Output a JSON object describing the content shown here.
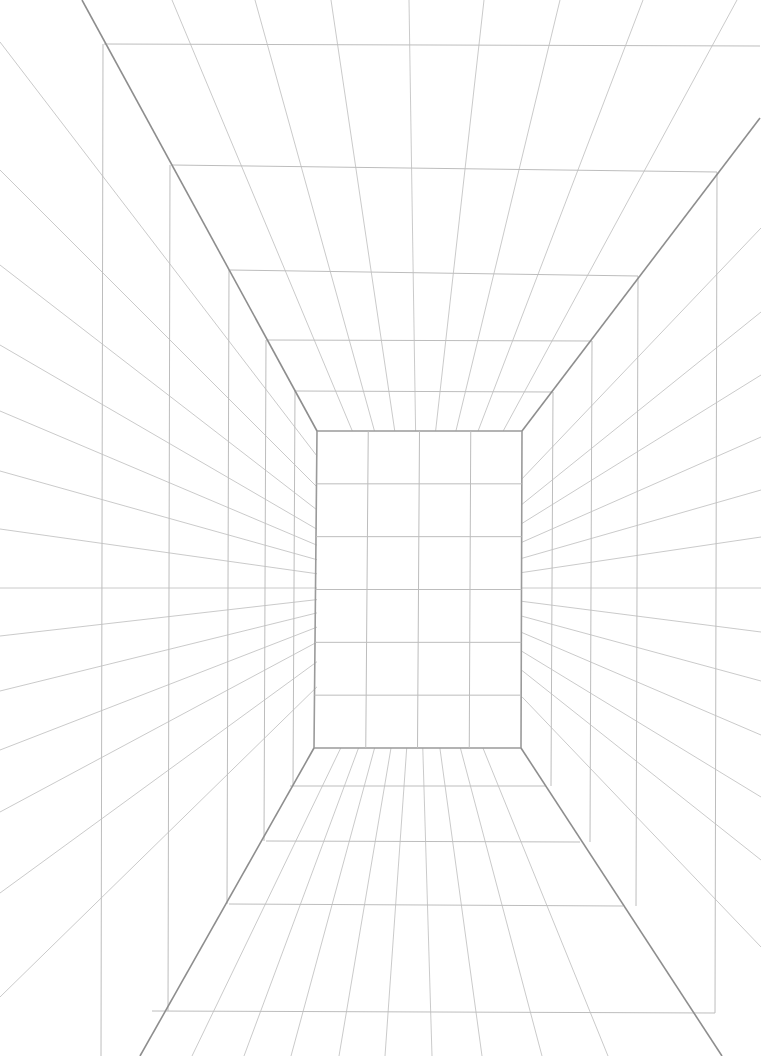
{
  "drawing": {
    "type": "one-point perspective room grid",
    "colors": {
      "background": "#ffffff",
      "guide": "#c4c4c4",
      "grid": "#bdbdbd",
      "edge": "#8e8e8e",
      "back": "#9a9a9a"
    },
    "vanishing_point": [
      418,
      588
    ],
    "back_wall": {
      "tl": [
        317,
        431
      ],
      "tr": [
        522,
        431
      ],
      "bl": [
        314,
        748
      ],
      "br": [
        521,
        748
      ],
      "cols": 4,
      "rows": 6
    },
    "corner_edges": [
      [
        [
          82,
          0
        ],
        [
          317,
          431
        ]
      ],
      [
        [
          760,
          118
        ],
        [
          522,
          431
        ]
      ],
      [
        [
          140,
          1056
        ],
        [
          314,
          748
        ]
      ],
      [
        [
          722,
          1056
        ],
        [
          521,
          748
        ]
      ]
    ],
    "ceiling_rays_top_x": [
      172,
      255,
      331,
      409,
      484,
      560,
      643,
      737
    ],
    "floor_rays_bottom_x": [
      192,
      244,
      291,
      339,
      385,
      432,
      482,
      542,
      608
    ],
    "left_rays_edge_y": [
      42,
      170,
      265,
      345,
      411,
      471,
      529,
      588,
      636,
      691,
      750,
      812,
      893,
      997
    ],
    "right_rays_edge_y": [
      228,
      312,
      375,
      437,
      490,
      537,
      588,
      632,
      681,
      735,
      797,
      860,
      947
    ],
    "ceiling_horizontals": [
      {
        "y1": 44,
        "y2": 46,
        "x1": 104,
        "x2": 760
      },
      {
        "y1": 165,
        "y2": 172,
        "x1": 172,
        "x2": 717
      },
      {
        "y1": 270,
        "y2": 276,
        "x1": 230,
        "x2": 638
      },
      {
        "y1": 340,
        "y2": 341,
        "x1": 267,
        "x2": 592
      },
      {
        "y1": 391,
        "y2": 392,
        "x1": 295,
        "x2": 553
      }
    ],
    "floor_horizontals": [
      {
        "y1": 786,
        "y2": 786,
        "x1": 290,
        "x2": 546
      },
      {
        "y1": 841,
        "y2": 842,
        "x1": 266,
        "x2": 580
      },
      {
        "y1": 904,
        "y2": 906,
        "x1": 229,
        "x2": 623
      },
      {
        "y1": 1011,
        "y2": 1013,
        "x1": 152,
        "x2": 715
      }
    ],
    "left_verticals": [
      {
        "x": 103,
        "y1": 44,
        "y2": 1056
      },
      {
        "x": 170,
        "y1": 165,
        "y2": 1011
      },
      {
        "x": 229,
        "y1": 270,
        "y2": 904
      },
      {
        "x": 266,
        "y1": 340,
        "y2": 841
      },
      {
        "x": 295,
        "y1": 391,
        "y2": 786
      }
    ],
    "right_verticals": [
      {
        "x": 717,
        "y1": 172,
        "y2": 1013
      },
      {
        "x": 638,
        "y1": 276,
        "y2": 906
      },
      {
        "x": 592,
        "y1": 341,
        "y2": 842
      },
      {
        "x": 553,
        "y1": 392,
        "y2": 786
      }
    ]
  }
}
